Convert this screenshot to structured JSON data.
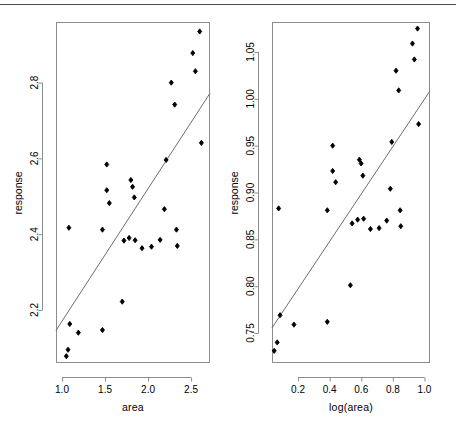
{
  "figure": {
    "background": "#ffffff",
    "foreground": "#000000",
    "axis_color": "#8c8c8c",
    "point_color": "#000000",
    "line_color": "#6e6e6e",
    "top_rule_color": "#4a4a4a",
    "panel_count": 2
  },
  "chart_data": [
    {
      "type": "scatter",
      "panel": "left",
      "title": "",
      "xlabel": "area",
      "ylabel": "response",
      "xlim": [
        0.93,
        2.72
      ],
      "ylim": [
        2.06,
        2.96
      ],
      "grid": false,
      "legend": null,
      "xticks": [
        1.0,
        1.5,
        2.0,
        2.5
      ],
      "xticklabels": [
        "1.0",
        "1.5",
        "2.0",
        "2.5"
      ],
      "yticks": [
        2.2,
        2.4,
        2.6,
        2.8
      ],
      "yticklabels": [
        "2.2",
        "2.4",
        "2.6",
        "2.8"
      ],
      "x": [
        1.05,
        1.07,
        1.08,
        1.09,
        1.19,
        1.47,
        1.47,
        1.52,
        1.52,
        1.55,
        1.7,
        1.72,
        1.78,
        1.8,
        1.82,
        1.84,
        1.85,
        1.93,
        2.04,
        2.14,
        2.19,
        2.21,
        2.27,
        2.31,
        2.33,
        2.34,
        2.52,
        2.55,
        2.6,
        2.62
      ],
      "y": [
        2.078,
        2.095,
        2.417,
        2.163,
        2.14,
        2.147,
        2.412,
        2.584,
        2.516,
        2.482,
        2.222,
        2.383,
        2.39,
        2.543,
        2.525,
        2.497,
        2.384,
        2.363,
        2.367,
        2.385,
        2.466,
        2.596,
        2.8,
        2.742,
        2.412,
        2.369,
        2.878,
        2.83,
        2.935,
        2.641
      ],
      "fit_line": {
        "x": [
          0.93,
          2.72
        ],
        "y": [
          2.146,
          2.772
        ],
        "label": "least-squares fit"
      }
    },
    {
      "type": "scatter",
      "panel": "right",
      "title": "",
      "xlabel": "log(area)",
      "ylabel": "response",
      "xlim": [
        0.035,
        1.035
      ],
      "ylim": [
        0.718,
        1.082
      ],
      "grid": false,
      "legend": null,
      "xticks": [
        0.2,
        0.4,
        0.6,
        0.8,
        1.0
      ],
      "xticklabels": [
        "0.2",
        "0.4",
        "0.6",
        "0.8",
        "1.0"
      ],
      "yticks": [
        0.75,
        0.8,
        0.85,
        0.9,
        0.95,
        1.0,
        1.05
      ],
      "yticklabels": [
        "0.75",
        "0.80",
        "0.85",
        "0.90",
        "0.95",
        "1.00",
        "1.05"
      ],
      "x": [
        0.049,
        0.068,
        0.077,
        0.086,
        0.174,
        0.385,
        0.385,
        0.419,
        0.419,
        0.438,
        0.531,
        0.542,
        0.577,
        0.588,
        0.599,
        0.61,
        0.615,
        0.658,
        0.713,
        0.761,
        0.784,
        0.793,
        0.82,
        0.837,
        0.846,
        0.85,
        0.924,
        0.936,
        0.956,
        0.963
      ],
      "y": [
        0.731,
        0.74,
        0.883,
        0.769,
        0.759,
        0.762,
        0.881,
        0.95,
        0.923,
        0.911,
        0.801,
        0.867,
        0.871,
        0.935,
        0.931,
        0.918,
        0.872,
        0.861,
        0.862,
        0.87,
        0.904,
        0.954,
        1.03,
        1.009,
        0.881,
        0.864,
        1.059,
        1.042,
        1.075,
        0.973
      ],
      "fit_line": {
        "x": [
          0.035,
          1.035
        ],
        "y": [
          0.7555,
          1.0085
        ],
        "label": "least-squares fit"
      }
    }
  ],
  "panels": {
    "left": {
      "x_axis_title": "area",
      "y_axis_title": "response",
      "x_tick_labels": [
        "1.0",
        "1.5",
        "2.0",
        "2.5"
      ],
      "y_tick_labels": [
        "2.2",
        "2.4",
        "2.6",
        "2.8"
      ]
    },
    "right": {
      "x_axis_title": "log(area)",
      "y_axis_title": "response",
      "x_tick_labels": [
        "0.2",
        "0.4",
        "0.6",
        "0.8",
        "1.0"
      ],
      "y_tick_labels": [
        "0.75",
        "0.80",
        "0.85",
        "0.90",
        "0.95",
        "1.00",
        "1.05"
      ]
    }
  }
}
